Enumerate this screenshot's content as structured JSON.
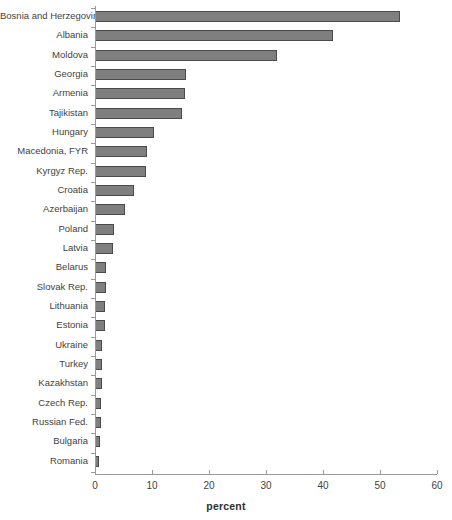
{
  "chart": {
    "type": "bar",
    "orientation": "horizontal",
    "background_color": "#ffffff",
    "bar_fill_color": "#7f7f7f",
    "bar_border_color": "#4a4a4a",
    "axis_color": "#9a9a9a"
  },
  "chart_data": {
    "type": "bar",
    "title": "",
    "subtitle": "",
    "xlabel": "percent",
    "ylabel": "",
    "xlim": [
      0,
      60
    ],
    "ylim": null,
    "grid": false,
    "legend": null,
    "orientation": "horizontal",
    "xticks": [
      0,
      10,
      20,
      30,
      40,
      50,
      60
    ],
    "xtick_labels": [
      "0",
      "10",
      "20",
      "30",
      "40",
      "50",
      "60"
    ],
    "categories": [
      "Bosnia and Herzegovina",
      "Albania",
      "Moldova",
      "Georgia",
      "Armenia",
      "Tajikistan",
      "Hungary",
      "Macedonia, FYR",
      "Kyrgyz Rep.",
      "Croatia",
      "Azerbaijan",
      "Poland",
      "Latvia",
      "Belarus",
      "Slovak Rep.",
      "Lithuania",
      "Estonia",
      "Ukraine",
      "Turkey",
      "Kazakhstan",
      "Czech Rep.",
      "Russian Fed.",
      "Bulgaria",
      "Romania"
    ],
    "values": [
      53.5,
      41.8,
      32.0,
      15.9,
      15.8,
      15.2,
      10.4,
      9.1,
      9.0,
      6.9,
      5.3,
      3.3,
      3.2,
      2.0,
      1.9,
      1.8,
      1.7,
      1.3,
      1.2,
      1.2,
      1.1,
      1.0,
      0.8,
      0.7
    ]
  }
}
